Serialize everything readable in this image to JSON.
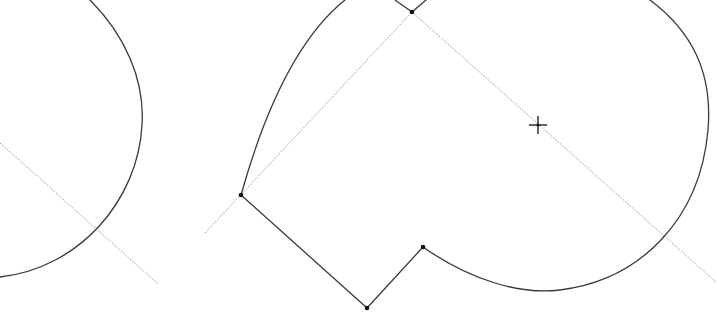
{
  "canvas": {
    "width": 717,
    "height": 319,
    "background": "#ffffff",
    "geometry_color": "#3a3a3a",
    "construction_color": "#8c8c8c",
    "vertex_color": "#111111"
  },
  "left_shape": {
    "arc_path": "M 90 0 C 125 35 145 80 142 125 C 138 200 80 268 0 277",
    "construction_line": {
      "x1": 0,
      "y1": 143,
      "x2": 158,
      "y2": 284
    }
  },
  "main_shape": {
    "vertices": [
      {
        "id": "v-top",
        "x": 412,
        "y": 12
      },
      {
        "id": "v-left",
        "x": 241,
        "y": 195
      },
      {
        "id": "v-bottom",
        "x": 367,
        "y": 308
      },
      {
        "id": "v-notch",
        "x": 423,
        "y": 247
      }
    ],
    "top_edge_left": {
      "x1": 395,
      "y1": 0,
      "x2": 412,
      "y2": 12
    },
    "top_edge_right": {
      "x1": 412,
      "y1": 12,
      "x2": 426,
      "y2": 0
    },
    "left_curve_path": "M 241 195 C 262 120 295 40 345 0",
    "lower_edges_path": "M 241 195 L 367 308 L 423 247",
    "right_arc_path": "M 423 247 C 470 280 520 295 560 290 C 640 280 700 220 708 130 C 713 70 690 30 650 0",
    "construction_lines": [
      {
        "x1": 205,
        "y1": 233,
        "x2": 412,
        "y2": 12
      },
      {
        "x1": 412,
        "y1": 12,
        "x2": 717,
        "y2": 283
      }
    ]
  },
  "cursor": {
    "type": "crosshair",
    "x": 538,
    "y": 125,
    "arm": 9
  }
}
